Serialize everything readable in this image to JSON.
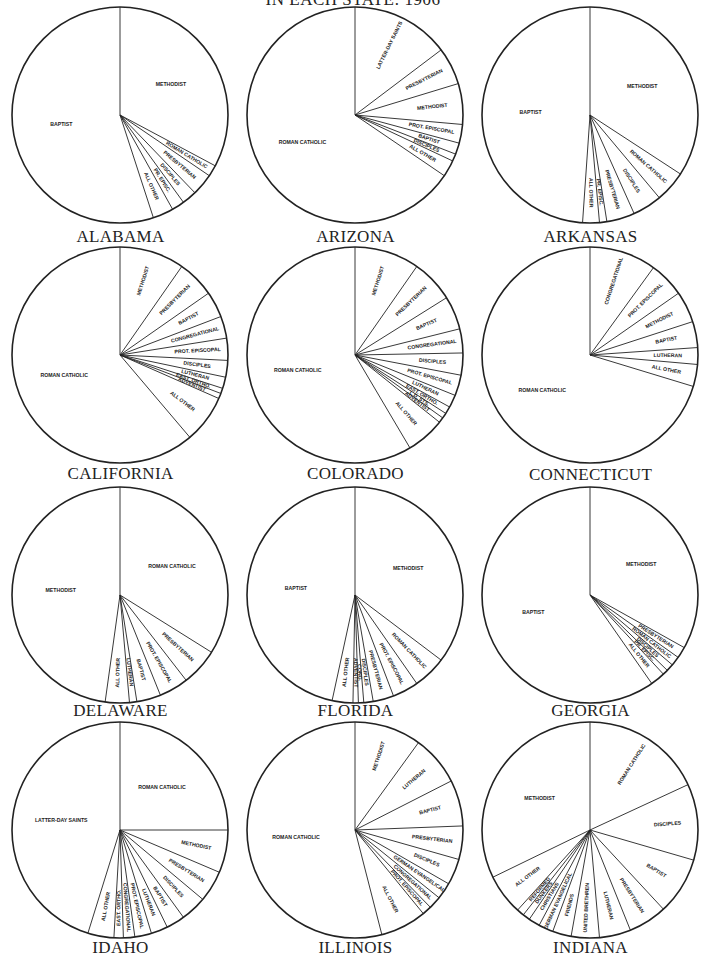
{
  "page": {
    "title": "IN EACH STATE: 1906"
  },
  "chart_data": [
    {
      "type": "pie",
      "title": "ALABAMA",
      "start": "12 o'clock, clockwise",
      "categories": [
        "Methodist",
        "Roman Catholic",
        "Presbyterian",
        "Disciples",
        "Prot. Episc.",
        "All Other",
        "Baptist"
      ],
      "labels": [
        "METHODIST",
        "ROMAN CATHOLIC",
        "PRESBYTERIAN",
        "DISCIPLES",
        "PR. EPISC.",
        "ALL OTHER",
        "BAPTIST"
      ],
      "values": [
        32.8,
        1.7,
        3.3,
        2.2,
        1.9,
        3.1,
        55.0
      ]
    },
    {
      "type": "pie",
      "title": "ARIZONA",
      "start": "12 o'clock, clockwise",
      "categories": [
        "Latter-day Saints",
        "Presbyterian",
        "Methodist",
        "Prot. Episcopal",
        "Baptist",
        "Disciples",
        "All Other",
        "Roman Catholic"
      ],
      "labels": [
        "LATTER-DAY SAINTS",
        "PRESBYTERIAN",
        "METHODIST",
        "PROT. EPISCOPAL",
        "BAPTIST",
        "DISCIPLES",
        "ALL OTHER",
        "ROMAN CATHOLIC"
      ],
      "values": [
        14.7,
        5.6,
        6.1,
        2.8,
        1.7,
        1.1,
        2.5,
        65.5
      ]
    },
    {
      "type": "pie",
      "title": "ARKANSAS",
      "start": "12 o'clock, clockwise",
      "categories": [
        "Methodist",
        "Roman Catholic",
        "Disciples",
        "Presbyterian",
        "Prot. Episc.",
        "All Other",
        "Baptist"
      ],
      "labels": [
        "METHODIST",
        "ROMAN CATHOLIC",
        "DISCIPLES",
        "PRESBYTERIAN",
        "PR. EPISC.",
        "ALL OTHER",
        "BAPTIST"
      ],
      "values": [
        34.2,
        4.7,
        4.4,
        4.2,
        1.1,
        2.5,
        48.9
      ]
    },
    {
      "type": "pie",
      "title": "CALIFORNIA",
      "start": "12 o'clock, clockwise",
      "categories": [
        "Methodist",
        "Presbyterian",
        "Baptist",
        "Congregational",
        "Prot. Episcopal",
        "Disciples",
        "Lutheran",
        "East. Ortho.",
        "Adventist",
        "All Other",
        "Roman Catholic"
      ],
      "labels": [
        "METHODIST",
        "PRESBYTERIAN",
        "BAPTIST",
        "CONGREGATIONAL",
        "PROT. EPISCOPAL",
        "DISCIPLES",
        "LUTHERAN",
        "EAST. ORTHO.",
        "ADVENTIST",
        "ALL OTHER",
        "ROMAN CATHOLIC"
      ],
      "values": [
        9.7,
        5.6,
        3.9,
        3.3,
        3.3,
        2.5,
        1.7,
        0.8,
        0.8,
        7.2,
        61.2
      ]
    },
    {
      "type": "pie",
      "title": "COLORADO",
      "start": "12 o'clock, clockwise",
      "categories": [
        "Methodist",
        "Presbyterian",
        "Baptist",
        "Congregational",
        "Disciples",
        "Prot. Episcopal",
        "Lutheran",
        "East. Ortho.",
        "L.D. Sts.",
        "Adventist",
        "All Other",
        "Roman Catholic"
      ],
      "labels": [
        "METHODIST",
        "PRESBYTERIAN",
        "BAPTIST",
        "CONGREGATIONAL",
        "DISCIPLES",
        "PROT. EPISCOPAL",
        "LUTHERAN",
        "EAST. ORTHO.",
        "L.D. STS.",
        "ADVENTIST",
        "ALL OTHER",
        "ROMAN CATHOLIC"
      ],
      "values": [
        9.7,
        6.4,
        5.0,
        3.6,
        3.3,
        3.1,
        1.9,
        1.1,
        0.8,
        0.8,
        5.8,
        58.5
      ]
    },
    {
      "type": "pie",
      "title": "CONNECTICUT",
      "start": "12 o'clock, clockwise",
      "categories": [
        "Congregational",
        "Prot. Episcopal",
        "Methodist",
        "Baptist",
        "Lutheran",
        "All Other",
        "Roman Catholic"
      ],
      "labels": [
        "CONGREGATIONAL",
        "PROT. EPISCOPAL",
        "METHODIST",
        "BAPTIST",
        "LUTHERAN",
        "ALL OTHER",
        "ROMAN CATHOLIC"
      ],
      "values": [
        10.0,
        5.3,
        4.7,
        3.9,
        2.5,
        3.3,
        70.3
      ]
    },
    {
      "type": "pie",
      "title": "DELAWARE",
      "start": "12 o'clock, clockwise",
      "categories": [
        "Roman Catholic",
        "Presbyterian",
        "Prot. Episcopal",
        "Baptist",
        "Lutheran",
        "All Other",
        "Methodist"
      ],
      "labels": [
        "ROMAN CATHOLIC",
        "PRESBYTERIAN",
        "PROT. EPISCOPAL",
        "BAPTIST",
        "LUTHERAN",
        "ALL OTHER",
        "METHODIST"
      ],
      "values": [
        33.9,
        5.6,
        4.4,
        3.6,
        1.1,
        3.6,
        47.8
      ]
    },
    {
      "type": "pie",
      "title": "FLORIDA",
      "start": "12 o'clock, clockwise",
      "categories": [
        "Methodist",
        "Roman Catholic",
        "Prot. Episcopal",
        "Presbyterian",
        "Disciples",
        "Cong.",
        "Adventist",
        "All Other",
        "Baptist"
      ],
      "labels": [
        "METHODIST",
        "ROMAN CATHOLIC",
        "PROT. EPISCOPAL",
        "PRESBYTERIAN",
        "DISCIPLES",
        "CONG.",
        "ADVENTIST",
        "ALL OTHER",
        "BAPTIST"
      ],
      "values": [
        35.3,
        5.0,
        3.9,
        3.1,
        1.4,
        0.8,
        0.8,
        3.1,
        46.6
      ]
    },
    {
      "type": "pie",
      "title": "GEORGIA",
      "start": "12 o'clock, clockwise",
      "categories": [
        "Methodist",
        "Presbyterian",
        "Roman Catholic",
        "Disciples",
        "Pr. Episc.",
        "All Other",
        "Baptist"
      ],
      "labels": [
        "METHODIST",
        "PRESBYTERIAN",
        "ROMAN CATHOLIC",
        "DISCIPLES",
        "PR. EPISC.",
        "ALL OTHER",
        "BAPTIST"
      ],
      "values": [
        33.1,
        1.7,
        1.4,
        1.1,
        0.8,
        2.2,
        59.7
      ]
    },
    {
      "type": "pie",
      "title": "IDAHO",
      "start": "12 o'clock, clockwise",
      "categories": [
        "Roman Catholic",
        "Methodist",
        "Presbyterian",
        "Disciples",
        "Baptist",
        "Lutheran",
        "Prot. Episcopal",
        "Congregational",
        "East. Ortho.",
        "All Other",
        "Latter-day Saints"
      ],
      "labels": [
        "ROMAN CATHOLIC",
        "METHODIST",
        "PRESBYTERIAN",
        "DISCIPLES",
        "BAPTIST",
        "LUTHERAN",
        "PROT. EPISCOPAL",
        "CONGREGATIONAL",
        "EAST. ORTHO.",
        "ALL OTHER",
        "LATTER-DAY SAINTS"
      ],
      "values": [
        25.0,
        6.4,
        4.7,
        3.9,
        2.8,
        2.5,
        2.5,
        1.7,
        1.4,
        3.9,
        45.2
      ]
    },
    {
      "type": "pie",
      "title": "ILLINOIS",
      "start": "12 o'clock, clockwise",
      "categories": [
        "Methodist",
        "Lutheran",
        "Baptist",
        "Presbyterian",
        "Disciples",
        "German Evangelical",
        "Congregational",
        "Prot. Episcopal",
        "All Other",
        "Roman Catholic"
      ],
      "labels": [
        "METHODIST",
        "LUTHERAN",
        "BAPTIST",
        "PRESBYTERIAN",
        "DISCIPLES",
        "GERMAN EVANGELICAL",
        "CONGREGATIONAL",
        "PROT. EPISCOPAL",
        "ALL OTHER",
        "ROMAN CATHOLIC"
      ],
      "values": [
        10.0,
        7.5,
        6.9,
        5.0,
        3.9,
        2.5,
        1.9,
        1.4,
        6.9,
        54.0
      ]
    },
    {
      "type": "pie",
      "title": "INDIANA",
      "start": "12 o'clock, clockwise",
      "categories": [
        "Roman Catholic",
        "Disciples",
        "Baptist",
        "Presbyterian",
        "Lutheran",
        "United Brethren",
        "Friends",
        "German Evangelical",
        "Christians",
        "Dunkers",
        "Reformed",
        "All Other",
        "Methodist"
      ],
      "labels": [
        "ROMAN CATHOLIC",
        "DISCIPLES",
        "BAPTIST",
        "PRESBYTERIAN",
        "LUTHERAN",
        "UNITED BRETHREN",
        "FRIENDS",
        "GERMAN EVANGELICAL",
        "CHRISTIANS",
        "DUNKERS",
        "REFORMED",
        "ALL OTHER",
        "METHODIST"
      ],
      "values": [
        18.1,
        11.4,
        8.6,
        5.8,
        4.7,
        4.2,
        2.8,
        2.2,
        1.7,
        1.1,
        1.1,
        6.1,
        32.2
      ]
    }
  ]
}
